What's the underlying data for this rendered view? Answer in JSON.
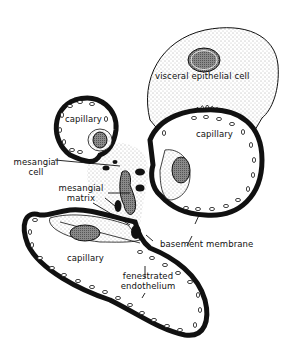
{
  "diagram": {
    "title_fragment": "",
    "colors": {
      "ink": "#111111",
      "stipple": "#e6e6e6",
      "nucleus": "#7a7a7a",
      "background": "#ffffff"
    },
    "labels": {
      "visceral_epithelial_cell": "visceral epithelial cell",
      "capillary_upper_left": "capillary",
      "capillary_right": "capillary",
      "capillary_lower": "capillary",
      "mesangial_cell_line1": "mesangial",
      "mesangial_cell_line2": "cell",
      "mesangial_matrix_line1": "mesangial",
      "mesangial_matrix_line2": "matrix",
      "basement_membrane": "basement membrane",
      "fenestrated_line1": "fenestrated",
      "fenestrated_line2": "endothelium"
    }
  }
}
